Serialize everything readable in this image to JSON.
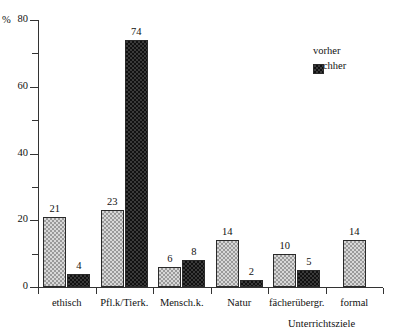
{
  "chart_data": {
    "type": "bar",
    "title": "",
    "xlabel": "Unterrichtsziele",
    "ylabel": "%",
    "ylim": [
      0,
      80
    ],
    "yticks": [
      0,
      20,
      40,
      60,
      80
    ],
    "yminorticks": [
      10,
      30,
      50,
      70
    ],
    "grid": false,
    "legend_position": "top-right",
    "categories": [
      "ethisch",
      "Pfl.k/Tierk.",
      "Mensch.k.",
      "Natur",
      "fächerübergr.",
      "formal"
    ],
    "series": [
      {
        "name": "vorher",
        "values": [
          21,
          23,
          6,
          14,
          10,
          14
        ]
      },
      {
        "name": "nachher",
        "values": [
          4,
          74,
          8,
          2,
          5,
          null
        ]
      }
    ]
  },
  "axis": {
    "y_unit": "%",
    "y_top_label": "80",
    "y_tick_labels": [
      "0",
      "20",
      "40",
      "60",
      "80"
    ],
    "x_title": "Unterrichtsziele"
  },
  "legend": {
    "items": [
      {
        "label": "vorher",
        "style": "light-checker"
      },
      {
        "label": "nachher",
        "style": "dark-checker"
      }
    ]
  },
  "colors": {
    "axis": "#333333",
    "vorher_fill": "#d8d8d8",
    "vorher_pattern": "#9a9a9a",
    "nachher_fill": "#3a3a3a",
    "nachher_pattern": "#111111",
    "text": "#111111",
    "background": "#ffffff"
  }
}
